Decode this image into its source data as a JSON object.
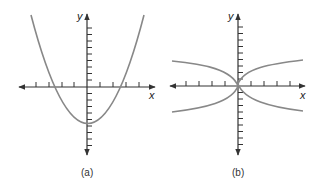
{
  "figures": [
    {
      "id": "a",
      "caption": "(a)",
      "x_axis_label": "x",
      "y_axis_label": "y",
      "curve": "upward-opening parabola with vertex below the origin",
      "curve_color": "#888888",
      "axis_color": "#333333"
    },
    {
      "id": "b",
      "caption": "(b)",
      "x_axis_label": "x",
      "y_axis_label": "y",
      "curve": "two sideways parabolas opening left and right, meeting near the origin",
      "curve_color": "#888888",
      "axis_color": "#333333"
    }
  ]
}
